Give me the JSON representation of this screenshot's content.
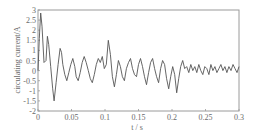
{
  "chart_data": {
    "type": "line",
    "title": "",
    "xlabel": "t / s",
    "ylabel": "circulating current/A",
    "xlim": [
      0,
      0.3
    ],
    "ylim": [
      -2,
      3
    ],
    "grid": false,
    "legend": null,
    "x_ticks": [
      "0",
      "0.05",
      "0.1",
      "0.15",
      "0.2",
      "0.25",
      "0.3"
    ],
    "y_ticks": [
      "3",
      "2.5",
      "2",
      "1.5",
      "1",
      "0.5",
      "0",
      "-0.5",
      "-1",
      "-1.5",
      "-2"
    ],
    "line_color": "#555555",
    "series": [
      {
        "name": "circulating current",
        "x": [
          0,
          0.002,
          0.004,
          0.006,
          0.009,
          0.012,
          0.014,
          0.016,
          0.019,
          0.022,
          0.024,
          0.027,
          0.03,
          0.033,
          0.035,
          0.037,
          0.04,
          0.043,
          0.046,
          0.049,
          0.052,
          0.055,
          0.057,
          0.06,
          0.063,
          0.066,
          0.069,
          0.072,
          0.075,
          0.078,
          0.081,
          0.084,
          0.087,
          0.09,
          0.093,
          0.096,
          0.099,
          0.102,
          0.105,
          0.108,
          0.111,
          0.114,
          0.117,
          0.12,
          0.123,
          0.126,
          0.129,
          0.132,
          0.135,
          0.138,
          0.141,
          0.144,
          0.147,
          0.15,
          0.153,
          0.156,
          0.159,
          0.162,
          0.165,
          0.168,
          0.171,
          0.174,
          0.177,
          0.18,
          0.183,
          0.186,
          0.189,
          0.192,
          0.195,
          0.198,
          0.201,
          0.204,
          0.207,
          0.21,
          0.213,
          0.216,
          0.219,
          0.222,
          0.225,
          0.228,
          0.231,
          0.234,
          0.237,
          0.24,
          0.243,
          0.246,
          0.249,
          0.252,
          0.255,
          0.258,
          0.261,
          0.264,
          0.267,
          0.27,
          0.273,
          0.276,
          0.279,
          0.282,
          0.285,
          0.288,
          0.291,
          0.294,
          0.297,
          0.3
        ],
        "y": [
          0.0,
          1.6,
          2.85,
          2.2,
          0.4,
          0.5,
          1.7,
          1.3,
          0.2,
          -0.9,
          -1.5,
          -0.6,
          0.3,
          1.1,
          0.9,
          0.3,
          -0.2,
          -0.5,
          -0.1,
          0.3,
          0.6,
          0.2,
          -0.3,
          -0.5,
          -0.1,
          0.4,
          0.7,
          0.4,
          0.0,
          -0.4,
          -0.6,
          -0.2,
          0.3,
          0.6,
          0.4,
          0.7,
          0.1,
          0.3,
          1.5,
          0.8,
          -0.3,
          -0.8,
          -0.2,
          0.5,
          0.2,
          -0.3,
          -0.5,
          0.1,
          0.4,
          0.6,
          0.1,
          -0.2,
          -0.3,
          0.3,
          0.6,
          0.2,
          -0.3,
          -0.7,
          -0.1,
          0.4,
          0.6,
          0.1,
          -0.3,
          -0.6,
          0.1,
          0.5,
          0.3,
          -0.4,
          -0.9,
          -0.3,
          0.2,
          -0.2,
          -1.1,
          -0.4,
          0.2,
          0.5,
          0.1,
          0.2,
          -0.1,
          0.3,
          0.0,
          0.2,
          -0.1,
          0.3,
          0.0,
          -0.2,
          0.2,
          0.1,
          -0.2,
          0.3,
          0.0,
          0.2,
          -0.1,
          0.1,
          0.3,
          0.0,
          0.2,
          -0.1,
          0.2,
          0.0,
          0.3,
          0.1,
          -0.1,
          0.2
        ]
      }
    ]
  }
}
